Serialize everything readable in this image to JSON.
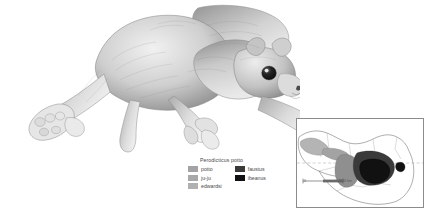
{
  "figure": {
    "subject_common_name": "potto",
    "illustration_medium": "graphite pencil drawing",
    "background_color": "#ffffff"
  },
  "legend": {
    "title": "Perodicticus potto",
    "columns": [
      {
        "entries": [
          {
            "label": "potto",
            "color": "#a3a3a3"
          },
          {
            "label": "ju-ju",
            "color": "#a8a8a8"
          },
          {
            "label": "edwardsi",
            "color": "#b0b0b0"
          }
        ]
      },
      {
        "entries": [
          {
            "label": "faustus",
            "color": "#3a3a3a"
          },
          {
            "label": "ibeanus",
            "color": "#111111"
          }
        ]
      }
    ]
  },
  "map": {
    "scale_value": "2000 km",
    "scale_zero": "0",
    "attribution": "",
    "equator_line": true,
    "border_color": "#8c8c8c",
    "range_colors": {
      "potto": "#a3a3a3",
      "ju_ju": "#8f8f8f",
      "edwardsi": "#b4b4b4",
      "faustus": "#3a3a3a",
      "ibeanus": "#111111"
    }
  }
}
